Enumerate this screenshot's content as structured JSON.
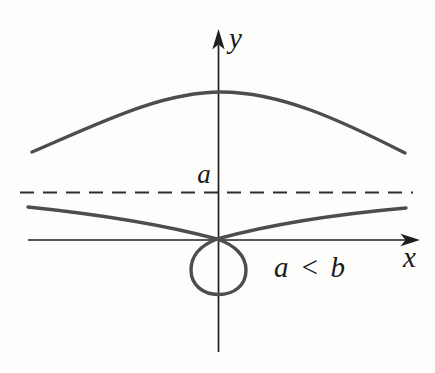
{
  "figure": {
    "labels": {
      "y_axis": "y",
      "x_axis": "x",
      "asymptote": "a",
      "condition": "a < b"
    },
    "colors": {
      "background": "#fdfdfc",
      "curve": "#4d4d4d",
      "axis": "#1f1f1f",
      "dashed_line": "#2d2d2d",
      "text": "#1a1a1a"
    }
  }
}
